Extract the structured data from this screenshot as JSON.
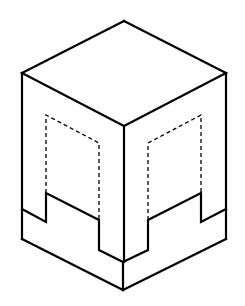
{
  "figure": {
    "colors": {
      "line": "#000000",
      "background": "#ffffff"
    },
    "solid_paths": [
      {
        "name": "top-face",
        "points": "124,21 226,73 124,126 22,73 124,21"
      },
      {
        "name": "front-vertical-edge-upper",
        "points": "124,126 124,262"
      },
      {
        "name": "left-outer-edge",
        "points": "22,73 22,239"
      },
      {
        "name": "right-outer-edge",
        "points": "226,73 226,239"
      },
      {
        "name": "bottom-left-edge",
        "points": "22,239 123,290"
      },
      {
        "name": "bottom-right-edge",
        "points": "123,290 226,239"
      },
      {
        "name": "front-bottom-vertical",
        "points": "123,262 123,290"
      },
      {
        "name": "left-step-profile",
        "points": "22,209 46,222 46,193 99,220 99,250 123,262"
      },
      {
        "name": "right-step-profile",
        "points": "123,262 148,250 148,220 201,193 201,222 226,209"
      }
    ],
    "hidden_paths": [
      {
        "name": "left-hidden-recess",
        "points": "46,193 46,115 99,143 99,220"
      },
      {
        "name": "right-hidden-recess",
        "points": "148,220 148,143 201,115 201,193"
      }
    ]
  }
}
